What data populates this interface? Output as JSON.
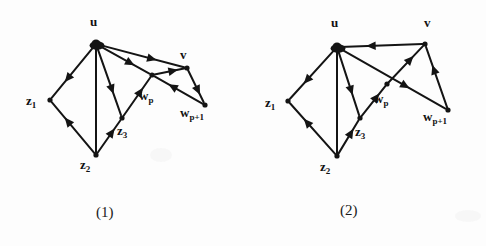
{
  "figure": {
    "background_color": "#fdfdfd",
    "ink_color": "#141414",
    "panels": [
      {
        "id": "panel-1",
        "caption": "(1)",
        "caption_pos": {
          "x": 96,
          "y": 205
        },
        "nodes": [
          {
            "id": "u",
            "label_main": "u",
            "label_sub": "",
            "x": 96,
            "y": 44,
            "label_x": 90,
            "label_y": 15
          },
          {
            "id": "z1",
            "label_main": "z",
            "label_sub": "1",
            "x": 50,
            "y": 100,
            "label_x": 26,
            "label_y": 94
          },
          {
            "id": "z2",
            "label_main": "z",
            "label_sub": "2",
            "x": 96,
            "y": 155,
            "label_x": 80,
            "label_y": 158
          },
          {
            "id": "z3",
            "label_main": "z",
            "label_sub": "3",
            "x": 122,
            "y": 118,
            "label_x": 117,
            "label_y": 124
          },
          {
            "id": "wp",
            "label_main": "w",
            "label_sub": "p",
            "x": 152,
            "y": 75,
            "label_x": 139,
            "label_y": 89
          },
          {
            "id": "v",
            "label_main": "v",
            "label_sub": "",
            "x": 187,
            "y": 68,
            "label_x": 180,
            "label_y": 48
          },
          {
            "id": "wp1",
            "label_main": "w",
            "label_sub": "p+1",
            "x": 205,
            "y": 105,
            "label_x": 180,
            "label_y": 106
          }
        ],
        "edges": [
          {
            "from": "u",
            "to": "z1",
            "arrow": "to"
          },
          {
            "from": "u",
            "to": "z2",
            "arrow": "none"
          },
          {
            "from": "u",
            "to": "z3",
            "arrow": "to"
          },
          {
            "from": "u",
            "to": "wp",
            "arrow": "to"
          },
          {
            "from": "u",
            "to": "v",
            "arrow": "to"
          },
          {
            "from": "z2",
            "to": "z1",
            "arrow": "to"
          },
          {
            "from": "z2",
            "to": "z3",
            "arrow": "to"
          },
          {
            "from": "z3",
            "to": "wp",
            "arrow": "to"
          },
          {
            "from": "wp",
            "to": "v",
            "arrow": "to"
          },
          {
            "from": "v",
            "to": "wp1",
            "arrow": "to"
          },
          {
            "from": "wp1",
            "to": "wp",
            "arrow": "to"
          }
        ]
      },
      {
        "id": "panel-2",
        "caption": "(2)",
        "caption_pos": {
          "x": 340,
          "y": 203
        },
        "nodes": [
          {
            "id": "u",
            "label_main": "u",
            "label_sub": "",
            "x": 337,
            "y": 47,
            "label_x": 331,
            "label_y": 16
          },
          {
            "id": "z1",
            "label_main": "z",
            "label_sub": "1",
            "x": 288,
            "y": 101,
            "label_x": 265,
            "label_y": 96
          },
          {
            "id": "z2",
            "label_main": "z",
            "label_sub": "2",
            "x": 337,
            "y": 156,
            "label_x": 320,
            "label_y": 160
          },
          {
            "id": "z3",
            "label_main": "z",
            "label_sub": "3",
            "x": 360,
            "y": 118,
            "label_x": 355,
            "label_y": 125
          },
          {
            "id": "wp",
            "label_main": "w",
            "label_sub": "p",
            "x": 387,
            "y": 84,
            "label_x": 374,
            "label_y": 92
          },
          {
            "id": "v",
            "label_main": "v",
            "label_sub": "",
            "x": 425,
            "y": 44,
            "label_x": 424,
            "label_y": 16
          },
          {
            "id": "wp1",
            "label_main": "w",
            "label_sub": "p+1",
            "x": 448,
            "y": 110,
            "label_x": 423,
            "label_y": 110
          }
        ],
        "edges": [
          {
            "from": "u",
            "to": "z1",
            "arrow": "to"
          },
          {
            "from": "u",
            "to": "z2",
            "arrow": "none"
          },
          {
            "from": "u",
            "to": "z3",
            "arrow": "to"
          },
          {
            "from": "u",
            "to": "wp1",
            "arrow": "to"
          },
          {
            "from": "v",
            "to": "u",
            "arrow": "to"
          },
          {
            "from": "z2",
            "to": "z1",
            "arrow": "to"
          },
          {
            "from": "z2",
            "to": "z3",
            "arrow": "to"
          },
          {
            "from": "z3",
            "to": "wp",
            "arrow": "to"
          },
          {
            "from": "wp",
            "to": "v",
            "arrow": "to"
          },
          {
            "from": "wp1",
            "to": "v",
            "arrow": "to"
          }
        ]
      }
    ]
  }
}
